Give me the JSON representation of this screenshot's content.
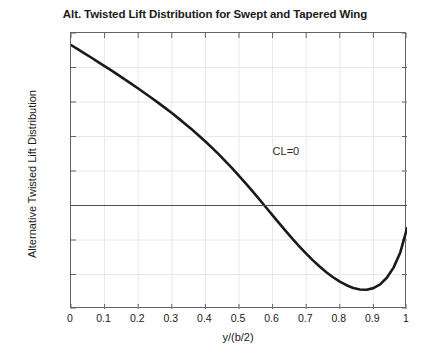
{
  "chart_data": {
    "type": "line",
    "title": "Alt. Twisted Lift Distribution for Swept and Tapered Wing",
    "xlabel": "y/(b/2)",
    "ylabel": "Alternative Twisted Lift Distribution",
    "xlim": [
      0,
      1
    ],
    "ylim": [
      -0.06,
      0.1
    ],
    "grid": true,
    "legend": null,
    "xticks": [
      "0",
      "0.1",
      "0.2",
      "0.3",
      "0.4",
      "0.5",
      "0.6",
      "0.7",
      "0.8",
      "0.9",
      "1"
    ],
    "xtick_values": [
      0,
      0.1,
      0.2,
      0.3,
      0.4,
      0.5,
      0.6,
      0.7,
      0.8,
      0.9,
      1
    ],
    "yticks": [
      "0.1",
      "0.08",
      "0.06",
      "0.04",
      "0.02",
      "0",
      "-0.02",
      "-0.04",
      "-0.06"
    ],
    "ytick_values": [
      0.1,
      0.08,
      0.06,
      0.04,
      0.02,
      0,
      -0.02,
      -0.04,
      -0.06
    ],
    "annotations": [
      {
        "text": "CL=0",
        "x": 0.6,
        "y": 0.031
      }
    ],
    "series": [
      {
        "name": "Alternative twisted lift distribution",
        "color": "#1a1a1a",
        "linewidth": 2.6,
        "x": [
          0,
          0.02,
          0.04,
          0.06,
          0.08,
          0.1,
          0.12,
          0.14,
          0.16,
          0.18,
          0.2,
          0.22,
          0.24,
          0.26,
          0.28,
          0.3,
          0.32,
          0.34,
          0.36,
          0.38,
          0.4,
          0.42,
          0.44,
          0.46,
          0.48,
          0.5,
          0.52,
          0.54,
          0.56,
          0.58,
          0.6,
          0.62,
          0.64,
          0.66,
          0.68,
          0.7,
          0.72,
          0.74,
          0.76,
          0.78,
          0.8,
          0.82,
          0.84,
          0.86,
          0.88,
          0.9,
          0.92,
          0.94,
          0.96,
          0.98,
          1.0
        ],
        "y": [
          0.093,
          0.0906,
          0.0882,
          0.0858,
          0.0833,
          0.0808,
          0.0783,
          0.0757,
          0.0731,
          0.0705,
          0.0678,
          0.0651,
          0.0623,
          0.0595,
          0.0566,
          0.0536,
          0.0505,
          0.0473,
          0.044,
          0.0406,
          0.0371,
          0.0334,
          0.0296,
          0.0256,
          0.0215,
          0.0172,
          0.0128,
          0.0083,
          0.0037,
          -0.001,
          -0.0057,
          -0.0104,
          -0.015,
          -0.0195,
          -0.0238,
          -0.0279,
          -0.0318,
          -0.0354,
          -0.0387,
          -0.0416,
          -0.0441,
          -0.0462,
          -0.0478,
          -0.0487,
          -0.0488,
          -0.0479,
          -0.0457,
          -0.0419,
          -0.036,
          -0.0272,
          -0.0133
        ]
      },
      {
        "name": "zero-reference-line",
        "color": "#4f4f4f",
        "linewidth": 1.0,
        "x": [
          0,
          1
        ],
        "y": [
          0,
          0
        ]
      }
    ]
  },
  "colors": {
    "background": "#ffffff",
    "axis": "#636363",
    "grid": "#e8e8e8",
    "curve": "#1a1a1a",
    "text": "#1a1a1a"
  }
}
